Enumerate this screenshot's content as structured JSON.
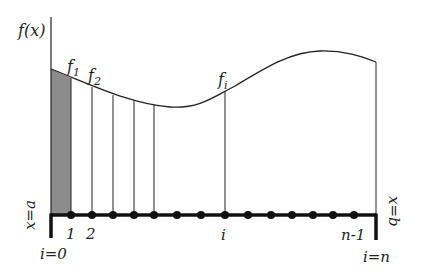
{
  "diagram": {
    "y_axis_label": "f(x)",
    "left_bound_label": "x=a",
    "right_bound_label": "x=b",
    "left_index_label": "i=0",
    "right_index_label": "i=n",
    "function_labels": {
      "f1": {
        "base": "f",
        "sub": "1"
      },
      "f2": {
        "base": "f",
        "sub": "2"
      },
      "fi": {
        "base": "f",
        "sub": "i"
      }
    },
    "tick_labels": {
      "one": "1",
      "two": "2",
      "i": "i",
      "n_minus_1": "n-1"
    },
    "colors": {
      "line": "#222222",
      "shaded_strip": "#8c8c8c",
      "axis": "#111111"
    }
  }
}
